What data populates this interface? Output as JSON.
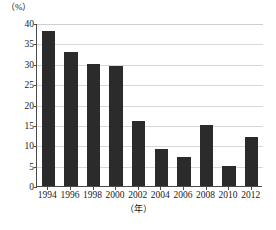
{
  "chart_data": {
    "type": "bar",
    "title": "",
    "subtitle": "",
    "xlabel": "（年）",
    "ylabel": "（%）",
    "categories": [
      "1994",
      "1996",
      "1998",
      "2000",
      "2002",
      "2004",
      "2006",
      "2008",
      "2010",
      "2012"
    ],
    "values": [
      38,
      33,
      30,
      29.5,
      16,
      9,
      7,
      15,
      5,
      12
    ],
    "series": [
      {
        "name": "",
        "values": [
          38,
          33,
          30,
          29.5,
          16,
          9,
          7,
          15,
          5,
          12
        ]
      }
    ],
    "ylim": [
      0,
      40
    ],
    "ytick_values": [
      0,
      5,
      10,
      15,
      20,
      25,
      30,
      35,
      40
    ],
    "ytick_labels": [
      "0",
      "5",
      "10",
      "15",
      "20",
      "25",
      "30",
      "35",
      "40"
    ],
    "xtick_labels": [
      "1994",
      "1996",
      "1998",
      "2000",
      "2002",
      "2004",
      "2006",
      "2008",
      "2010",
      "2012"
    ],
    "grid": true,
    "grid_axis": "y",
    "legend": false,
    "legend_position": "none",
    "bar_color": "#2b2b2b",
    "grid_color": "#d8d8d8",
    "axis_color": "#4a4a4a",
    "background_color": "#ffffff",
    "annotations": []
  }
}
